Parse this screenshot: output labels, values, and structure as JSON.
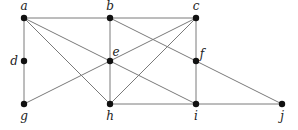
{
  "diagram": {
    "type": "graph",
    "nodes": [
      {
        "id": "a",
        "label": "a",
        "x": 24,
        "y": 18,
        "lx": 24,
        "ly": 10
      },
      {
        "id": "b",
        "label": "b",
        "x": 110,
        "y": 18,
        "lx": 110,
        "ly": 10
      },
      {
        "id": "c",
        "label": "c",
        "x": 196,
        "y": 18,
        "lx": 196,
        "ly": 10
      },
      {
        "id": "d",
        "label": "d",
        "x": 24,
        "y": 61,
        "lx": 14,
        "ly": 65
      },
      {
        "id": "e",
        "label": "e",
        "x": 110,
        "y": 61,
        "lx": 116,
        "ly": 56
      },
      {
        "id": "f",
        "label": "f",
        "x": 196,
        "y": 61,
        "lx": 202,
        "ly": 58
      },
      {
        "id": "g",
        "label": "g",
        "x": 24,
        "y": 104,
        "lx": 24,
        "ly": 120
      },
      {
        "id": "h",
        "label": "h",
        "x": 110,
        "y": 104,
        "lx": 110,
        "ly": 120
      },
      {
        "id": "i",
        "label": "i",
        "x": 196,
        "y": 104,
        "lx": 196,
        "ly": 120
      },
      {
        "id": "j",
        "label": "j",
        "x": 282,
        "y": 104,
        "lx": 282,
        "ly": 120
      }
    ],
    "edges": [
      [
        "a",
        "b"
      ],
      [
        "b",
        "c"
      ],
      [
        "a",
        "d"
      ],
      [
        "d",
        "g"
      ],
      [
        "a",
        "e"
      ],
      [
        "e",
        "i"
      ],
      [
        "a",
        "h"
      ],
      [
        "b",
        "e"
      ],
      [
        "e",
        "h"
      ],
      [
        "b",
        "f"
      ],
      [
        "f",
        "j"
      ],
      [
        "g",
        "e"
      ],
      [
        "e",
        "c"
      ],
      [
        "c",
        "h"
      ],
      [
        "c",
        "f"
      ],
      [
        "f",
        "i"
      ],
      [
        "h",
        "i"
      ],
      [
        "i",
        "j"
      ]
    ],
    "colors": {
      "edge": "#7a7a7a",
      "node": "#111111",
      "label": "#222222"
    }
  }
}
